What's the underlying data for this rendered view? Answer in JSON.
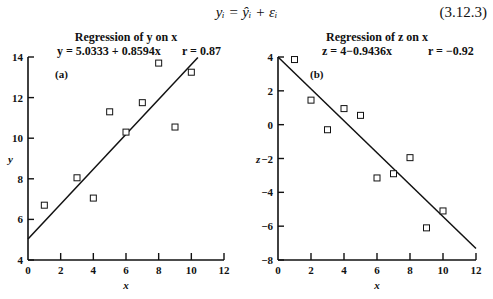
{
  "header": {
    "equation": "yᵢ = ŷᵢ + εᵢ",
    "equation_number": "(3.12.3)"
  },
  "chart_data": [
    {
      "type": "scatter",
      "panel_label": "(a)",
      "title": "Regression of y on x",
      "fit_equation": "y = 5.0333 + 0.8594x",
      "r_label": "r = 0.87",
      "xlabel": "x",
      "ylabel": "y",
      "xlim": [
        0,
        12
      ],
      "ylim": [
        4,
        14
      ],
      "xticks": [
        0,
        2,
        4,
        6,
        8,
        10,
        12
      ],
      "yticks": [
        4,
        6,
        8,
        10,
        12,
        14
      ],
      "grid": false,
      "points": {
        "x": [
          1,
          3,
          4,
          5,
          6,
          7,
          8,
          9,
          10
        ],
        "y": [
          6.7,
          8.05,
          7.05,
          11.3,
          10.3,
          11.75,
          13.7,
          10.55,
          13.25
        ]
      },
      "fit_line": {
        "intercept": 5.0333,
        "slope": 0.8594,
        "x_range": [
          0,
          10.4
        ]
      },
      "marker": "open-square"
    },
    {
      "type": "scatter",
      "panel_label": "(b)",
      "title": "Regression of z on x",
      "fit_equation": "z = 4−0.9436x",
      "r_label": "r = −0.92",
      "xlabel": "x",
      "ylabel": "z",
      "xlim": [
        0,
        12
      ],
      "ylim": [
        -8,
        4
      ],
      "xticks": [
        0,
        2,
        4,
        6,
        8,
        10,
        12
      ],
      "yticks": [
        -8,
        -6,
        -4,
        -2,
        0,
        2,
        4
      ],
      "grid": false,
      "points": {
        "x": [
          1,
          2,
          3,
          4,
          5,
          6,
          7,
          8,
          9,
          10
        ],
        "y": [
          3.85,
          1.45,
          -0.3,
          0.95,
          0.55,
          -3.15,
          -2.9,
          -1.95,
          -6.1,
          -5.1
        ]
      },
      "fit_line": {
        "intercept": 4,
        "slope": -0.9436,
        "x_range": [
          0,
          12
        ]
      },
      "marker": "open-square"
    }
  ]
}
